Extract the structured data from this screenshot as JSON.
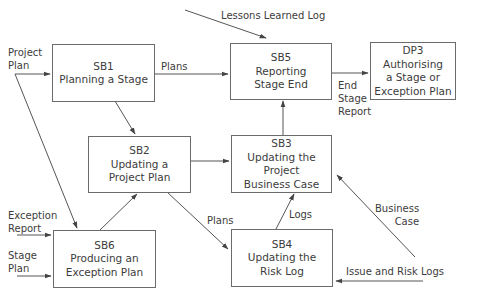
{
  "nodes": {
    "sb1": {
      "id": "SB1",
      "lines": [
        "Planning a Stage"
      ]
    },
    "sb2": {
      "id": "SB2",
      "lines": [
        "Updating a",
        "Project Plan"
      ]
    },
    "sb3": {
      "id": "SB3",
      "lines": [
        "Updating the",
        "Project",
        "Business Case"
      ]
    },
    "sb4": {
      "id": "SB4",
      "lines": [
        "Updating the",
        "Risk Log"
      ]
    },
    "sb5": {
      "id": "SB5",
      "lines": [
        "Reporting",
        "Stage End"
      ]
    },
    "sb6": {
      "id": "SB6",
      "lines": [
        "Producing an",
        "Exception Plan"
      ]
    },
    "dp3": {
      "id": "DP3",
      "lines": [
        "Authorising",
        "a Stage or",
        "Exception Plan"
      ]
    }
  },
  "labels": {
    "project_plan": [
      "Project",
      "Plan"
    ],
    "lessons_learned_log": "Lessons Learned Log",
    "plans_sb1_sb5": "Plans",
    "end_stage_report": [
      "End",
      "Stage",
      "Report"
    ],
    "plans_sb2_sb4": "Plans",
    "logs": "Logs",
    "business_case": [
      "Business",
      "Case"
    ],
    "exception_report": [
      "Exception",
      "Report"
    ],
    "stage_plan": [
      "Stage",
      "Plan"
    ],
    "issue_and_risk_logs": "Issue and Risk Logs"
  },
  "colors": {
    "line": "#555555",
    "box_border": "#6b6b6b",
    "text": "#3c3c3c"
  }
}
